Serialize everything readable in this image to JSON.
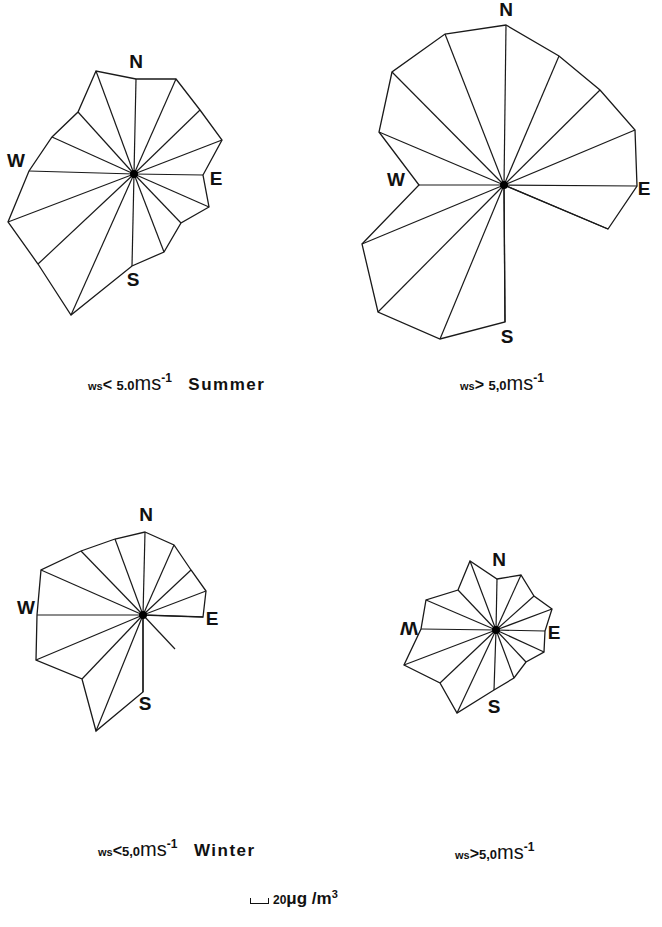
{
  "figure": {
    "scale_bar": {
      "value": "20",
      "unit": "μg /m",
      "unit_exp": "3",
      "length_px": 17
    }
  },
  "captions": {
    "summer_low": {
      "prefix": "ws",
      "comparator": "<",
      "value": "5.0",
      "unit": "ms",
      "exp": "-1",
      "season": "Summer"
    },
    "summer_high": {
      "prefix": "ws",
      "comparator": ">",
      "value": "5,0",
      "unit": "ms",
      "exp": "-1",
      "season": ""
    },
    "winter_low": {
      "prefix": "ws",
      "comparator": "<",
      "value": "5,0",
      "unit": "ms",
      "exp": "-1",
      "season": "Winter"
    },
    "winter_high": {
      "prefix": "ws",
      "comparator": ">",
      "value": "5,0",
      "unit": "ms",
      "exp": "-1",
      "season": ""
    }
  },
  "chart_data": [
    {
      "type": "radar",
      "title": "ws<5.0 ms-1 Summer",
      "center": [
        134,
        174
      ],
      "directions": [
        "N",
        "NNE",
        "NE",
        "ENE",
        "E",
        "ESE",
        "SE",
        "SSE",
        "S",
        "SSW",
        "SW",
        "WSW",
        "W",
        "WNW",
        "NW",
        "NNW"
      ],
      "vertices": [
        [
          136,
          79
        ],
        [
          176,
          79
        ],
        [
          200,
          110
        ],
        [
          222,
          140
        ],
        [
          203,
          175
        ],
        [
          209,
          207
        ],
        [
          181,
          223
        ],
        [
          164,
          252
        ],
        [
          132,
          266
        ],
        [
          71,
          315
        ],
        [
          38,
          264
        ],
        [
          8,
          222
        ],
        [
          29,
          171
        ],
        [
          52,
          137
        ],
        [
          78,
          112
        ],
        [
          96,
          71
        ]
      ],
      "values_ug_m3": [
        111,
        109,
        109,
        104,
        81,
        93,
        67,
        82,
        108,
        190,
        150,
        160,
        123,
        115,
        98,
        126
      ],
      "labels": {
        "N": [
          136,
          63
        ],
        "E": [
          216,
          180
        ],
        "S": [
          133,
          281
        ],
        "W": [
          16,
          162
        ]
      }
    },
    {
      "type": "radar",
      "title": "ws>5.0 ms-1 Summer",
      "center": [
        504,
        185
      ],
      "directions": [
        "N",
        "NNE",
        "NE",
        "ENE",
        "E",
        "ESE",
        "SE",
        "SSE",
        "S",
        "SSW",
        "SW",
        "WSW",
        "W",
        "WNW",
        "NW",
        "NNW"
      ],
      "vertices": [
        [
          506,
          25
        ],
        [
          559,
          56
        ],
        [
          600,
          90
        ],
        [
          635,
          130
        ],
        [
          637,
          186
        ],
        [
          608,
          229
        ],
        [
          504,
          185
        ],
        [
          504,
          185
        ],
        [
          505,
          322
        ],
        [
          440,
          339
        ],
        [
          378,
          312
        ],
        [
          362,
          244
        ],
        [
          419,
          185
        ],
        [
          379,
          132
        ],
        [
          392,
          72
        ],
        [
          445,
          34
        ]
      ],
      "values_ug_m3": [
        188,
        164,
        158,
        167,
        156,
        133,
        0,
        0,
        161,
        186,
        209,
        181,
        100,
        172,
        149,
        191
      ],
      "labels": {
        "N": [
          506,
          11
        ],
        "E": [
          644,
          190
        ],
        "S": [
          507,
          338
        ],
        "W": [
          396,
          181
        ]
      }
    },
    {
      "type": "radar",
      "title": "ws<5.0 ms-1 Winter",
      "center": [
        143,
        615
      ],
      "directions": [
        "N",
        "NNE",
        "NE",
        "ENE",
        "E",
        "ESE",
        "SE",
        "SSE",
        "S",
        "SSW",
        "SW",
        "WSW",
        "W",
        "WNW",
        "NW",
        "NNW"
      ],
      "vertices": [
        [
          145,
          532
        ],
        [
          174,
          545
        ],
        [
          191,
          570
        ],
        [
          206,
          591
        ],
        [
          203,
          617
        ],
        [
          143,
          615
        ],
        [
          175,
          649
        ],
        [
          143,
          615
        ],
        [
          143,
          692
        ],
        [
          96,
          731
        ],
        [
          82,
          679
        ],
        [
          36,
          660
        ],
        [
          37,
          615
        ],
        [
          41,
          570
        ],
        [
          81,
          551
        ],
        [
          115,
          539
        ]
      ],
      "values_ug_m3": [
        98,
        90,
        77,
        79,
        70,
        0,
        55,
        0,
        90,
        147,
        104,
        134,
        125,
        130,
        104,
        95
      ],
      "rays_only": [
        "SE"
      ],
      "labels": {
        "N": [
          146,
          516
        ],
        "E": [
          212,
          620
        ],
        "S": [
          145,
          705
        ],
        "W": [
          26,
          609
        ]
      }
    },
    {
      "type": "radar",
      "title": "ws>5.0 ms-1 Winter",
      "center": [
        496,
        630
      ],
      "directions": [
        "N",
        "NNE",
        "NE",
        "ENE",
        "E",
        "ESE",
        "SE",
        "SSE",
        "S",
        "SSW",
        "SW",
        "WSW",
        "W",
        "WNW",
        "NW",
        "NNW"
      ],
      "vertices": [
        [
          497,
          579
        ],
        [
          521,
          575
        ],
        [
          534,
          596
        ],
        [
          552,
          609
        ],
        [
          545,
          631
        ],
        [
          544,
          652
        ],
        [
          526,
          662
        ],
        [
          514,
          678
        ],
        [
          494,
          690
        ],
        [
          457,
          713
        ],
        [
          440,
          683
        ],
        [
          404,
          665
        ],
        [
          421,
          629
        ],
        [
          426,
          600
        ],
        [
          458,
          590
        ],
        [
          470,
          561
        ]
      ],
      "values_ug_m3": [
        60,
        71,
        60,
        70,
        58,
        62,
        51,
        60,
        70,
        107,
        90,
        115,
        88,
        89,
        65,
        86
      ],
      "labels": {
        "N": [
          499,
          561
        ],
        "E": [
          554,
          634
        ],
        "S": [
          494,
          708
        ],
        "W": [
          409,
          627
        ],
        "W_rotated": true
      }
    }
  ]
}
